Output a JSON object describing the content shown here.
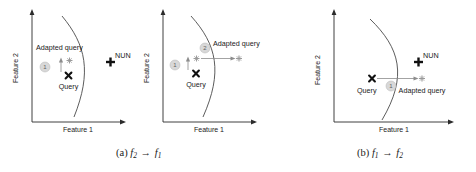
{
  "figure": {
    "panels": [
      {
        "id": "panel-a-left",
        "axis_x_label": "Feature 1",
        "axis_y_label": "Feature 2",
        "markers": [
          {
            "name": "query",
            "label": "Query",
            "glyph": "x-marker"
          },
          {
            "name": "adapted-query",
            "label": "Adapted query",
            "glyph": "light-cross-marker"
          },
          {
            "name": "nun",
            "label": "NUN",
            "glyph": "bold-plus-marker"
          }
        ],
        "steps": [
          {
            "number": "1"
          }
        ]
      },
      {
        "id": "panel-a-right",
        "axis_x_label": "Feature 1",
        "axis_y_label": "Feature 2",
        "markers": [
          {
            "name": "query",
            "label": "Query",
            "glyph": "x-marker"
          },
          {
            "name": "intermediate-query",
            "label": "",
            "glyph": "light-cross-marker"
          },
          {
            "name": "adapted-query",
            "label": "Adapted query",
            "glyph": "light-cross-marker"
          }
        ],
        "steps": [
          {
            "number": "1"
          },
          {
            "number": "2"
          }
        ]
      },
      {
        "id": "panel-b",
        "axis_x_label": "Feature 1",
        "axis_y_label": "Feature 2",
        "markers": [
          {
            "name": "query",
            "label": "Query",
            "glyph": "x-marker"
          },
          {
            "name": "adapted-query",
            "label": "Adapted query",
            "glyph": "light-cross-marker"
          },
          {
            "name": "nun",
            "label": "NUN",
            "glyph": "bold-plus-marker"
          }
        ],
        "steps": [
          {
            "number": "1"
          }
        ]
      }
    ],
    "captions": [
      {
        "id": "caption-a",
        "prefix": "(a)",
        "from": "f",
        "from_sub": "2",
        "arrow": "→",
        "to": "f",
        "to_sub": "1"
      },
      {
        "id": "caption-b",
        "prefix": "(b)",
        "from": "f",
        "from_sub": "1",
        "arrow": "→",
        "to": "f",
        "to_sub": "2"
      }
    ],
    "labels": {
      "feature1": "Feature 1",
      "feature2": "Feature 2",
      "query": "Query",
      "adapted_query": "Adapted query",
      "nun": "NUN",
      "step1": "1",
      "step2": "2"
    },
    "colors": {
      "ink": "#1a1a1a",
      "curve": "#4a4a4a",
      "arrow": "#8c8c8c",
      "badge_fill": "#d8d8d8",
      "badge_text": "#5f5f5f",
      "adapted_marker": "#9a9a9a"
    }
  }
}
